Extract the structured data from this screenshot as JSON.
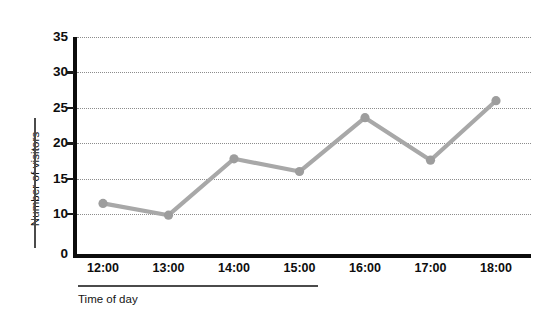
{
  "chart_data": {
    "type": "line",
    "title": "",
    "xlabel": "Time of day",
    "ylabel": "Number of visitors",
    "categories": [
      "12:00",
      "13:00",
      "14:00",
      "15:00",
      "16:00",
      "17:00",
      "18:00"
    ],
    "values": [
      11.5,
      9.7,
      17.8,
      16.0,
      23.6,
      17.6,
      26.0
    ],
    "series": [
      {
        "name": "Number of visitors",
        "values": [
          11.5,
          9.7,
          17.8,
          16.0,
          23.6,
          17.6,
          26.0
        ]
      }
    ],
    "ylim": [
      0,
      35
    ],
    "yticks": [
      0,
      10,
      15,
      20,
      25,
      30,
      35
    ],
    "ytick_labels": [
      "0",
      "10",
      "15",
      "20",
      "25",
      "30",
      "35"
    ],
    "xtick_labels": [
      "12:00",
      "13:00",
      "14:00",
      "15:00",
      "16:00",
      "17:00",
      "18:00"
    ],
    "grid": true,
    "grid_style": "dotted-horizontal",
    "legend": false,
    "legend_position": "none",
    "markers": "circle",
    "line_color": "#a8a8a8",
    "marker_color": "#9d9d9d",
    "axis_color": "#0c0c0c",
    "grid_color": "#8c8c8c",
    "text_color": "#0d0d0d",
    "background": "#ffffff"
  },
  "axis": {
    "y_title": "Number of visitors",
    "x_title": "Time of day"
  }
}
